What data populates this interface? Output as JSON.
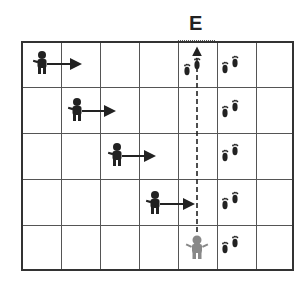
{
  "diagram": {
    "label": "E",
    "grid": {
      "columns": 7,
      "rows": 5
    },
    "walkers": [
      {
        "row": 1,
        "col": 1,
        "direction": "right"
      },
      {
        "row": 2,
        "col": 2,
        "direction": "right"
      },
      {
        "row": 3,
        "col": 3,
        "direction": "right"
      },
      {
        "row": 4,
        "col": 4,
        "direction": "right"
      }
    ],
    "observer": {
      "row": 5,
      "col": 5,
      "color": "gray",
      "path": "dashed line up to E"
    },
    "footprints": [
      {
        "row": 1,
        "col": 5
      },
      {
        "row": 1,
        "col": 6
      },
      {
        "row": 2,
        "col": 6
      },
      {
        "row": 3,
        "col": 6
      },
      {
        "row": 4,
        "col": 6
      },
      {
        "row": 5,
        "col": 6
      }
    ],
    "colors": {
      "figure": "#222222",
      "observer": "#888888",
      "grid": "#555555"
    }
  }
}
